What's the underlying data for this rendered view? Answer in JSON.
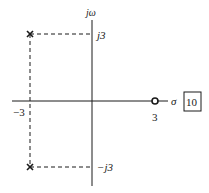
{
  "diagram": {
    "type": "pole-zero plot (s-plane)",
    "axes": {
      "vertical_label": "jω",
      "horizontal_label": "σ"
    },
    "ticks": {
      "real_neg": "−3",
      "real_pos": "3",
      "imag_pos": "j3",
      "imag_neg": "−j3"
    },
    "poles": [
      {
        "real": -3,
        "imag": 3,
        "marker": "×"
      },
      {
        "real": -3,
        "imag": -3,
        "marker": "×"
      }
    ],
    "zeros": [
      {
        "real": 3,
        "imag": 0,
        "marker": "o"
      }
    ],
    "gain_box": "10",
    "colors": {
      "ink": "#1a1a1a",
      "background": "#ffffff"
    }
  }
}
